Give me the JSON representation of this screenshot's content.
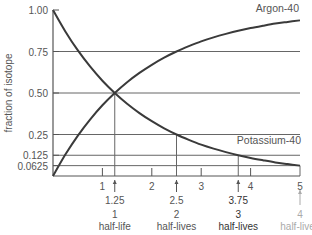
{
  "chart_data": {
    "type": "line",
    "title": "",
    "xlabel": "",
    "ylabel": "fraction of isotope",
    "xlim": [
      0,
      5
    ],
    "ylim": [
      0,
      1.0
    ],
    "y_ticks": [
      {
        "value": 1.0,
        "label": "1.00"
      },
      {
        "value": 0.75,
        "label": "0.75"
      },
      {
        "value": 0.5,
        "label": "0.50"
      },
      {
        "value": 0.25,
        "label": "0.25"
      },
      {
        "value": 0.125,
        "label": "0.125"
      },
      {
        "value": 0.0625,
        "label": "0.0625"
      }
    ],
    "x_ticks": [
      {
        "value": 1,
        "label": "1"
      },
      {
        "value": 2,
        "label": "2"
      },
      {
        "value": 3,
        "label": "3"
      },
      {
        "value": 4,
        "label": "4"
      },
      {
        "value": 5,
        "label": "5"
      }
    ],
    "half_life": 1.25,
    "series": [
      {
        "name": "Potassium-40",
        "label_position": "right-bottom",
        "x": [
          0,
          0.25,
          0.5,
          0.75,
          1.0,
          1.25,
          1.5,
          1.75,
          2.0,
          2.25,
          2.5,
          2.75,
          3.0,
          3.25,
          3.5,
          3.75,
          4.0,
          4.25,
          4.5,
          4.75,
          5.0
        ],
        "values": [
          1.0,
          0.871,
          0.758,
          0.66,
          0.574,
          0.5,
          0.435,
          0.379,
          0.33,
          0.287,
          0.25,
          0.218,
          0.189,
          0.165,
          0.144,
          0.125,
          0.109,
          0.095,
          0.082,
          0.072,
          0.0625
        ]
      },
      {
        "name": "Argon-40",
        "label_position": "top-right",
        "x": [
          0,
          0.25,
          0.5,
          0.75,
          1.0,
          1.25,
          1.5,
          1.75,
          2.0,
          2.25,
          2.5,
          2.75,
          3.0,
          3.25,
          3.5,
          3.75,
          4.0,
          4.25,
          4.5,
          4.75,
          5.0
        ],
        "values": [
          0.0,
          0.129,
          0.242,
          0.34,
          0.426,
          0.5,
          0.565,
          0.621,
          0.67,
          0.713,
          0.75,
          0.782,
          0.811,
          0.835,
          0.856,
          0.875,
          0.891,
          0.905,
          0.918,
          0.928,
          0.9375
        ]
      }
    ],
    "half_life_markers": [
      {
        "x": 1.25,
        "value_label": "1.25",
        "count_label": "1",
        "unit_label": "half-life",
        "y": 0.5,
        "style": "normal"
      },
      {
        "x": 2.5,
        "value_label": "2.5",
        "count_label": "2",
        "unit_label": "half-lives",
        "y": 0.25,
        "style": "normal"
      },
      {
        "x": 3.75,
        "value_label": "3.75",
        "count_label": "3",
        "unit_label": "half-lives",
        "y": 0.125,
        "style": "dark"
      },
      {
        "x": 5.0,
        "value_label": "",
        "count_label": "4",
        "unit_label": "half-lives",
        "y": 0.0625,
        "style": "faint"
      }
    ],
    "grid": false,
    "legend": "none"
  },
  "colors": {
    "curve": "#3a3a3a",
    "axis": "#555555",
    "guide": "#666666",
    "text": "#555555",
    "faint": "#aaaaaa"
  }
}
